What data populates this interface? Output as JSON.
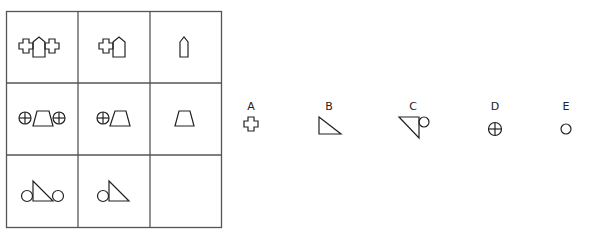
{
  "puzzle": {
    "type": "3x3 matrix reasoning",
    "grid": [
      [
        {
          "shape": "cross-pentagon-cross"
        },
        {
          "shape": "cross-pentagon"
        },
        {
          "shape": "pentagon"
        }
      ],
      [
        {
          "shape": "circlecross-trapezoid-circlecross"
        },
        {
          "shape": "circlecross-trapezoid"
        },
        {
          "shape": "trapezoid"
        }
      ],
      [
        {
          "shape": "circle-triangle-circle"
        },
        {
          "shape": "circle-triangle"
        },
        {
          "shape": "missing"
        }
      ]
    ],
    "options": [
      {
        "label": "A",
        "shape": "cross"
      },
      {
        "label": "B",
        "shape": "right-triangle"
      },
      {
        "label": "C",
        "shape": "triangle-circle"
      },
      {
        "label": "D",
        "shape": "circle-cross"
      },
      {
        "label": "E",
        "shape": "circle"
      }
    ]
  },
  "colors": {
    "stroke": "#222222",
    "grid": "#555555",
    "background": "#ffffff"
  }
}
